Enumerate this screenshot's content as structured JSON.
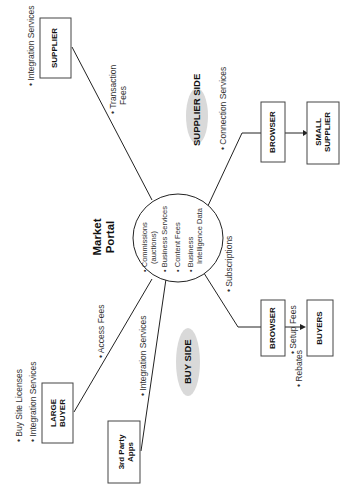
{
  "diagram": {
    "center": {
      "title_line1": "Market",
      "title_line2": "Portal",
      "items": [
        {
          "line1": "Commissions",
          "line2": "(auctions)"
        },
        {
          "line1": "Business Services",
          "line2": ""
        },
        {
          "line1": "Content Fees",
          "line2": ""
        },
        {
          "line1": "Business",
          "line2": "Intelligence Data"
        }
      ]
    },
    "regions": {
      "supplier_side": "SUPPLIER SIDE",
      "buy_side": "BUY SIDE"
    },
    "nodes": {
      "supplier": {
        "label": "SUPPLIER",
        "notes": [
          "Integration Services"
        ]
      },
      "browser_supplier": {
        "label": "BROWSER"
      },
      "small_supplier": {
        "line1": "SMALL",
        "line2": "SUPPLIER"
      },
      "browser_buyer": {
        "label": "BROWSER"
      },
      "buyers": {
        "label": "BUYERS"
      },
      "large_buyer": {
        "line1": "LARGE",
        "line2": "BUYER",
        "notes": [
          "Buy Site Licenses",
          "Integration Services"
        ]
      },
      "third_party": {
        "line1": "3rd Party",
        "line2": "Apps"
      }
    },
    "edges": {
      "transaction_fees": {
        "line1": "Transaction",
        "line2": "Fees"
      },
      "connection_services": "Connection Services",
      "subscriptions": "Subscriptions",
      "setup_fees": "Setup Fees",
      "rebates": "Rebates",
      "access_fees": "Access Fees",
      "integration_services_3p": "Integration Services"
    },
    "colors": {
      "line": "#222222",
      "ellipse_fill": "#d9d9d9",
      "box_border": "#444444"
    }
  }
}
